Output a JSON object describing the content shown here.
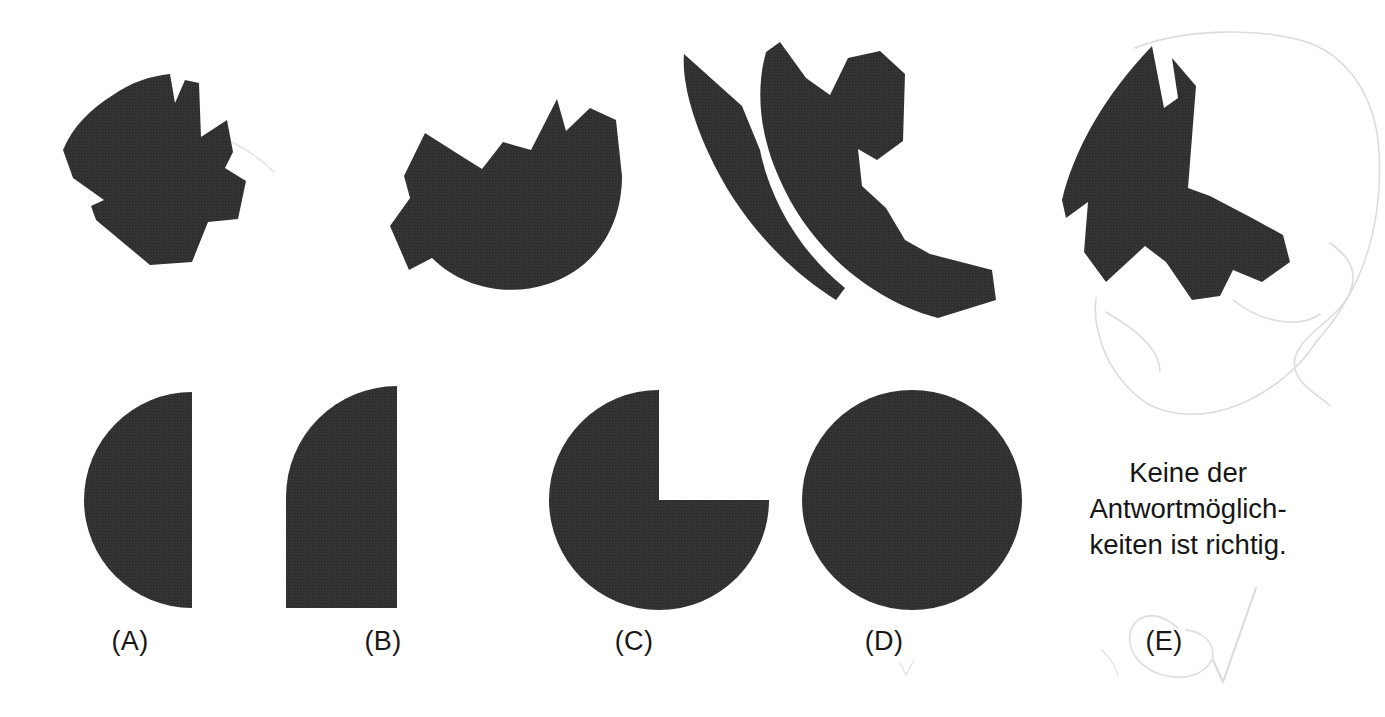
{
  "page": {
    "width": 1385,
    "height": 717,
    "background_color": "#ffffff",
    "shape_fill_color": "#323232",
    "pencil_color": "#d8d8d8",
    "task_type": "figure-assembly-multiple-choice"
  },
  "prompt_shapes": {
    "count": 4,
    "description_labels": [
      "fragment-1",
      "fragment-2",
      "fragment-3",
      "fragment-4"
    ]
  },
  "options": [
    {
      "key": "A",
      "label": "(A)",
      "shape": "left-half-circle"
    },
    {
      "key": "B",
      "label": "(B)",
      "shape": "quarter-circle"
    },
    {
      "key": "C",
      "label": "(C)",
      "shape": "three-quarter-circle"
    },
    {
      "key": "D",
      "label": "(D)",
      "shape": "full-circle"
    },
    {
      "key": "E",
      "label": "(E)",
      "shape": "text-option"
    }
  ],
  "option_e": {
    "label": "(E)",
    "lines": [
      "Keine der",
      "Antwortmöglich-",
      "keiten ist richtig."
    ],
    "full_text": "Keine der Antwortmöglichkeiten ist richtig."
  },
  "annotations": {
    "selected_option": "E",
    "marks": [
      "circle-around-E",
      "check-mark",
      "faint-circle-outline-top-right"
    ]
  }
}
